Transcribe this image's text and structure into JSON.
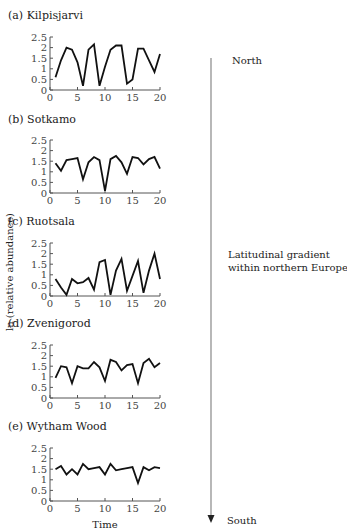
{
  "figure": {
    "ylabel": "ln (relative abundance)",
    "xlabel": "Time",
    "gradient": {
      "top_label": "North",
      "middle_label_line1": "Latitudinal gradient",
      "middle_label_line2": "within northern Europe",
      "bottom_label": "South"
    }
  },
  "chart_data": [
    {
      "type": "line",
      "title": "(a) Kilpisjarvi",
      "xlabel": "",
      "ylabel": "ln (relative abundance)",
      "xlim": [
        0,
        20
      ],
      "ylim": [
        0,
        2.5
      ],
      "xticks": [
        0,
        5,
        10,
        15,
        20
      ],
      "yticks": [
        0,
        0.5,
        1,
        1.5,
        2,
        2.5
      ],
      "x": [
        1,
        2,
        3,
        4,
        5,
        6,
        7,
        8,
        9,
        10,
        11,
        12,
        13,
        14,
        15,
        16,
        17,
        18,
        19,
        20
      ],
      "values": [
        0.6,
        1.4,
        2.0,
        1.9,
        1.3,
        0.2,
        1.9,
        2.15,
        0.2,
        1.1,
        1.9,
        2.1,
        2.1,
        0.3,
        0.5,
        1.95,
        1.95,
        1.4,
        0.85,
        1.7
      ]
    },
    {
      "type": "line",
      "title": "(b) Sotkamo",
      "xlabel": "",
      "ylabel": "ln (relative abundance)",
      "xlim": [
        0,
        20
      ],
      "ylim": [
        0,
        2.5
      ],
      "xticks": [
        0,
        5,
        10,
        15,
        20
      ],
      "yticks": [
        0,
        0.5,
        1,
        1.5,
        2,
        2.5
      ],
      "x": [
        1,
        2,
        3,
        4,
        5,
        6,
        7,
        8,
        9,
        10,
        11,
        12,
        13,
        14,
        15,
        16,
        17,
        18,
        19,
        20
      ],
      "values": [
        1.4,
        1.05,
        1.55,
        1.6,
        1.65,
        0.65,
        1.45,
        1.7,
        1.55,
        0.1,
        1.6,
        1.75,
        1.45,
        0.9,
        1.7,
        1.65,
        1.35,
        1.6,
        1.7,
        1.15
      ]
    },
    {
      "type": "line",
      "title": "(c) Ruotsala",
      "xlabel": "",
      "ylabel": "ln (relative abundance)",
      "xlim": [
        0,
        20
      ],
      "ylim": [
        0,
        2.5
      ],
      "xticks": [
        0,
        5,
        10,
        15,
        20
      ],
      "yticks": [
        0,
        0.5,
        1,
        1.5,
        2,
        2.5
      ],
      "x": [
        1,
        2,
        3,
        4,
        5,
        6,
        7,
        8,
        9,
        10,
        11,
        12,
        13,
        14,
        15,
        16,
        17,
        18,
        19,
        20
      ],
      "values": [
        0.8,
        0.4,
        0.05,
        0.8,
        0.6,
        0.65,
        0.85,
        0.3,
        1.6,
        1.7,
        0.05,
        1.2,
        1.75,
        0.25,
        0.95,
        1.65,
        0.15,
        1.2,
        2.0,
        0.8
      ]
    },
    {
      "type": "line",
      "title": "(d) Zvenigorod",
      "xlabel": "",
      "ylabel": "ln (relative abundance)",
      "xlim": [
        0,
        20
      ],
      "ylim": [
        0,
        2.5
      ],
      "xticks": [
        0,
        5,
        10,
        15,
        20
      ],
      "yticks": [
        0,
        0.5,
        1,
        1.5,
        2,
        2.5
      ],
      "x": [
        1,
        2,
        3,
        4,
        5,
        6,
        7,
        8,
        9,
        10,
        11,
        12,
        13,
        14,
        15,
        16,
        17,
        18,
        19,
        20
      ],
      "values": [
        0.95,
        1.5,
        1.45,
        0.7,
        1.5,
        1.4,
        1.4,
        1.7,
        1.45,
        0.8,
        1.8,
        1.7,
        1.3,
        1.55,
        1.6,
        0.7,
        1.65,
        1.85,
        1.45,
        1.65
      ]
    },
    {
      "type": "line",
      "title": "(e) Wytham Wood",
      "xlabel": "Time",
      "ylabel": "ln (relative abundance)",
      "xlim": [
        0,
        20
      ],
      "ylim": [
        0,
        2.5
      ],
      "xticks": [
        0,
        5,
        10,
        15,
        20
      ],
      "yticks": [
        0,
        0.5,
        1,
        1.5,
        2,
        2.5
      ],
      "x": [
        1,
        2,
        3,
        4,
        5,
        6,
        7,
        8,
        9,
        10,
        11,
        12,
        13,
        14,
        15,
        16,
        17,
        18,
        19,
        20
      ],
      "values": [
        1.5,
        1.65,
        1.25,
        1.5,
        1.25,
        1.75,
        1.5,
        1.55,
        1.6,
        1.25,
        1.75,
        1.45,
        1.5,
        1.55,
        1.6,
        0.85,
        1.6,
        1.45,
        1.6,
        1.55
      ]
    }
  ]
}
